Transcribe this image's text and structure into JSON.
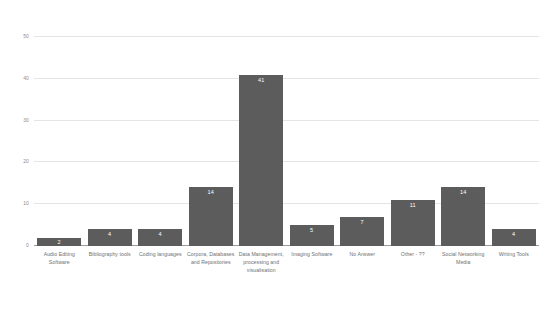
{
  "chart_data": {
    "type": "bar",
    "title": "",
    "subtitle": "",
    "xlabel": "",
    "ylabel": "",
    "ylim": [
      0,
      50
    ],
    "yticks": [
      0,
      10,
      20,
      30,
      40,
      50
    ],
    "grid": true,
    "legend": false,
    "legend_position": "none",
    "bar_color": "#5c5c5c",
    "background_color": "#ffffff",
    "gridline_color": "#e4e4e4",
    "axis_color": "#9a9a9a",
    "data_labels": true,
    "categories": [
      "Audio Editing Software",
      "Bibliography tools",
      "Coding languages",
      "Corpora, Databases and Repositories",
      "Data Management, processing and visualisation",
      "Imaging Software",
      "No Answer",
      "Other - ??",
      "Social Networking Media",
      "Writing Tools"
    ],
    "values": [
      2,
      4,
      4,
      14,
      41,
      5,
      7,
      11,
      14,
      4
    ],
    "value_labels": [
      "2",
      "4",
      "4",
      "14",
      "41",
      "5",
      "7",
      "11",
      "14",
      "4"
    ],
    "ytick_labels": [
      "0",
      "10",
      "20",
      "30",
      "40",
      "50"
    ]
  }
}
